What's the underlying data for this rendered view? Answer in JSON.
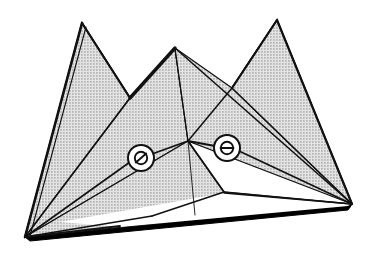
{
  "figure": {
    "type": "technical-line-drawing",
    "width": 381,
    "height": 256,
    "background_color": "#ffffff",
    "fill_color": "#c9c9c9",
    "fill_style": "halftone-dot-screen",
    "line_color": "#111111",
    "shadow_color": "#000000",
    "highlight_color": "#ffffff"
  },
  "callouts": [
    {
      "id": "callout-phi",
      "symbol": "Ø",
      "name": "angle-phi",
      "center_x": 141,
      "center_y": 158,
      "radius": 13
    },
    {
      "id": "callout-theta",
      "symbol": "θ",
      "name": "angle-theta",
      "center_x": 227,
      "center_y": 148,
      "radius": 13
    }
  ],
  "geometry": {
    "peaks": [
      {
        "name": "left-peak",
        "apex_x": 82,
        "apex_y": 23
      },
      {
        "name": "middle-peak",
        "apex_x": 175,
        "apex_y": 48
      },
      {
        "name": "right-peak",
        "apex_x": 277,
        "apex_y": 20
      }
    ],
    "valleys": [
      {
        "name": "left-valley",
        "x": 130,
        "y": 98
      },
      {
        "name": "right-valley",
        "x": 232,
        "y": 88
      }
    ],
    "base_vertices": [
      {
        "name": "bottom-left-vertex",
        "x": 25,
        "y": 237
      },
      {
        "name": "bottom-right-vertex",
        "x": 352,
        "y": 204
      }
    ],
    "junction": {
      "name": "center-junction",
      "x": 188,
      "y": 141
    },
    "inner_tip": {
      "name": "inner-triangle-tip",
      "x": 224,
      "y": 192
    }
  }
}
